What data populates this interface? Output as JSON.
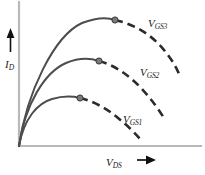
{
  "figure": {
    "background": "#ffffff",
    "axis_color": "#b9b9b9",
    "curve_color": "#4d4d4d",
    "dash_color": "#2b2b2b",
    "marker_fill": "#7a7a7a",
    "marker_stroke": "#3a3a3a",
    "text_color": "#1a1a1a"
  },
  "axes": {
    "y": {
      "name": "drain-current-axis",
      "symbol": "I",
      "subscript": "D",
      "arrow": "up-arrow"
    },
    "x": {
      "name": "drain-source-voltage-axis",
      "symbol": "V",
      "subscript": "DS",
      "arrow": "right-arrow"
    },
    "origin": {
      "x": 19,
      "y": 146
    },
    "x_end": 201,
    "y_top": 2
  },
  "chart_data": {
    "type": "line",
    "title": "",
    "xlabel": "V_DS",
    "ylabel": "I_D",
    "grid": false,
    "legend": "inline-curve-labels",
    "xlim": [
      0,
      205
    ],
    "ylim": [
      0,
      175
    ],
    "note": "MOSFET drain characteristics: solid rising segment to peak marker, then dashed falling segment",
    "series": [
      {
        "name": "V_GS1",
        "label_symbol": "V",
        "label_subscript": "GS1",
        "peak": {
          "x": 80,
          "y": 98
        },
        "solid_path": "M 19,146 C 24,118 38,103 52,99 C 62,96 72,96 80,98",
        "dash_path": "M 80,98 C 93,101 106,108 118,118 C 128,126 135,133 140,139",
        "end": {
          "x": 140,
          "y": 139
        }
      },
      {
        "name": "V_GS2",
        "label_symbol": "V",
        "label_subscript": "GS2",
        "peak": {
          "x": 99,
          "y": 61
        },
        "solid_path": "M 19,146 C 25,104 45,72 66,63 C 78,58 90,58 99,61",
        "dash_path": "M 99,61 C 114,65 129,75 142,89 C 152,100 159,110 164,118",
        "end": {
          "x": 164,
          "y": 118
        }
      },
      {
        "name": "V_GS3",
        "label_symbol": "V",
        "label_subscript": "GS3",
        "peak": {
          "x": 115,
          "y": 20
        },
        "solid_path": "M 19,146 C 27,92 54,36 82,23 C 95,18 107,17 115,20",
        "dash_path": "M 115,20 C 134,24 152,35 164,50 C 173,61 178,70 180,77",
        "end": {
          "x": 180,
          "y": 77
        }
      }
    ]
  }
}
